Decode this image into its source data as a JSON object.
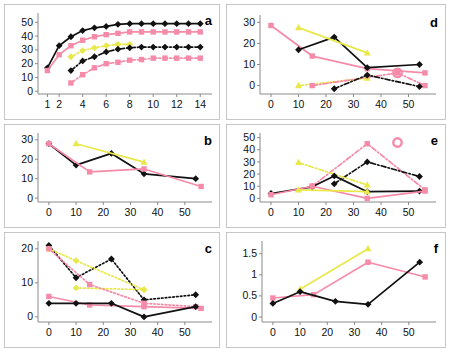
{
  "figure": {
    "title": "",
    "background": "#ffffff",
    "panel_count": 6,
    "colors": {
      "black": "#111111",
      "pink": "#f58ba8",
      "yellow": "#e9e84b",
      "axis": "#8a8a8a",
      "frame": "#b9b9b9"
    },
    "layout": "2 columns x 3 rows; left column a,b,c ; right column d,e,f"
  },
  "chart_data": [
    {
      "id": "a",
      "type": "line",
      "title": "a",
      "xlabel": "",
      "ylabel": "",
      "xlim": [
        0.2,
        15.0
      ],
      "ylim": [
        -2,
        56
      ],
      "xticks": [
        1,
        2,
        4,
        6,
        8,
        10,
        12,
        14
      ],
      "xticklabels": [
        "1",
        "2",
        "4",
        "6",
        "8",
        "10",
        "12",
        "14"
      ],
      "yticks": [
        0,
        10,
        20,
        30,
        40,
        50
      ],
      "yticklabels": [
        "0",
        "10",
        "20",
        "30",
        "40",
        "50"
      ],
      "grid": false,
      "legend": "none",
      "series": [
        {
          "name": "black-solid-diamond",
          "color": "#111111",
          "marker": "diamond",
          "linestyle": "solid",
          "x": [
            1,
            2,
            3,
            4,
            5,
            6,
            7,
            8,
            9,
            10,
            11,
            12,
            13,
            14
          ],
          "values": [
            17,
            33,
            39.5,
            44,
            46,
            47,
            48.5,
            49,
            49,
            49,
            49,
            49,
            49,
            49
          ]
        },
        {
          "name": "pink-solid-square-upper",
          "color": "#f58ba8",
          "marker": "square",
          "linestyle": "solid",
          "x": [
            1,
            2,
            3,
            4,
            5,
            6,
            7,
            8,
            9,
            10,
            11,
            12,
            13,
            14
          ],
          "values": [
            15,
            26.5,
            33,
            37,
            39.5,
            41,
            42,
            43,
            43,
            43,
            43,
            43,
            43,
            43
          ]
        },
        {
          "name": "yellow-dashdot-diamond",
          "color": "#e9e84b",
          "marker": "diamond",
          "linestyle": "dashdot",
          "x": [
            3,
            4,
            5,
            6,
            7,
            8
          ],
          "values": [
            25,
            29.5,
            31.5,
            33,
            34,
            34
          ]
        },
        {
          "name": "black-dashdot-diamond",
          "color": "#111111",
          "marker": "diamond",
          "linestyle": "dashdot",
          "x": [
            3,
            4,
            5,
            6,
            7,
            8,
            9,
            10,
            11,
            12,
            13,
            14
          ],
          "values": [
            15,
            22,
            25,
            28.5,
            30.5,
            31.5,
            32,
            32,
            32,
            32,
            32,
            32
          ]
        },
        {
          "name": "pink-dashdot-square-lower",
          "color": "#f58ba8",
          "marker": "square",
          "linestyle": "dashdot",
          "x": [
            3,
            4,
            5,
            6,
            7,
            8,
            9,
            10,
            11,
            12,
            13,
            14
          ],
          "values": [
            6,
            12,
            17,
            20,
            21,
            22.5,
            23,
            24,
            24,
            24,
            24,
            24
          ]
        }
      ]
    },
    {
      "id": "b",
      "type": "line",
      "title": "b",
      "xlabel": "",
      "ylabel": "",
      "xlim": [
        -4,
        60
      ],
      "ylim": [
        -2,
        33
      ],
      "xticks": [
        0,
        10,
        20,
        30,
        40,
        50
      ],
      "xticklabels": [
        "0",
        "10",
        "20",
        "30",
        "40",
        "50"
      ],
      "yticks": [
        0,
        10,
        20,
        30
      ],
      "yticklabels": [
        "0",
        "10",
        "20",
        "30"
      ],
      "grid": false,
      "legend": "none",
      "series": [
        {
          "name": "black-solid-diamond",
          "color": "#111111",
          "marker": "diamond",
          "linestyle": "solid",
          "x": [
            0,
            10,
            23,
            35,
            54
          ],
          "values": [
            28,
            17,
            23,
            12.5,
            10
          ]
        },
        {
          "name": "pink-solid-square",
          "color": "#f58ba8",
          "marker": "square",
          "linestyle": "solid",
          "x": [
            0,
            15,
            35,
            56
          ],
          "values": [
            28,
            13.5,
            15,
            6
          ]
        },
        {
          "name": "yellow-solid-triangle",
          "color": "#e9e84b",
          "marker": "triangle",
          "linestyle": "solid",
          "x": [
            10,
            35
          ],
          "values": [
            28,
            18.5
          ]
        }
      ]
    },
    {
      "id": "c",
      "type": "line",
      "title": "c",
      "xlabel": "",
      "ylabel": "",
      "xlim": [
        -4,
        60
      ],
      "ylim": [
        -1.5,
        22
      ],
      "xticks": [
        0,
        10,
        20,
        30,
        40,
        50
      ],
      "xticklabels": [
        "0",
        "10",
        "20",
        "30",
        "40",
        "50"
      ],
      "yticks": [
        0,
        10,
        20
      ],
      "yticklabels": [
        "0",
        "10",
        "20"
      ],
      "grid": false,
      "legend": "none",
      "series": [
        {
          "name": "black-dotted-diamond",
          "color": "#111111",
          "marker": "diamond",
          "linestyle": "dotted",
          "x": [
            0,
            10,
            23,
            35,
            54
          ],
          "values": [
            21,
            11.5,
            17,
            5,
            6.5
          ]
        },
        {
          "name": "yellow-dotted-upper",
          "color": "#e9e84b",
          "marker": "diamond",
          "linestyle": "dotted",
          "x": [
            0,
            10,
            35
          ],
          "values": [
            20,
            16.5,
            8
          ]
        },
        {
          "name": "yellow-dotted-lower",
          "color": "#e9e84b",
          "marker": "diamond",
          "linestyle": "dotted",
          "x": [
            10,
            35
          ],
          "values": [
            8.5,
            8
          ]
        },
        {
          "name": "pink-dotted-square",
          "color": "#f58ba8",
          "marker": "square",
          "linestyle": "dotted",
          "x": [
            0,
            15,
            35,
            54
          ],
          "values": [
            20,
            9.5,
            4,
            3
          ]
        },
        {
          "name": "pink-solid-square",
          "color": "#f58ba8",
          "marker": "square",
          "linestyle": "solid",
          "x": [
            0,
            15,
            35,
            56
          ],
          "values": [
            6,
            3.5,
            3,
            2.5
          ]
        },
        {
          "name": "black-solid-diamond",
          "color": "#111111",
          "marker": "diamond",
          "linestyle": "solid",
          "x": [
            0,
            10,
            23,
            35,
            54
          ],
          "values": [
            4,
            4,
            4,
            0,
            3
          ]
        }
      ]
    },
    {
      "id": "d",
      "type": "line",
      "title": "d",
      "xlabel": "",
      "ylabel": "",
      "xlim": [
        -4,
        60
      ],
      "ylim": [
        -4,
        33
      ],
      "xticks": [
        0,
        10,
        20,
        30,
        40,
        50
      ],
      "xticklabels": [
        "0",
        "10",
        "20",
        "30",
        "40",
        "50"
      ],
      "yticks": [
        0,
        10,
        20,
        30
      ],
      "yticklabels": [
        "0",
        "10",
        "20",
        "30"
      ],
      "grid": false,
      "legend": "none",
      "series": [
        {
          "name": "pink-solid-square-upper",
          "color": "#f58ba8",
          "marker": "square",
          "linestyle": "solid",
          "x": [
            0,
            15,
            35,
            56
          ],
          "values": [
            28.5,
            14,
            8,
            6
          ]
        },
        {
          "name": "black-solid-diamond",
          "color": "#111111",
          "marker": "diamond",
          "linestyle": "solid",
          "x": [
            10,
            23,
            35,
            54
          ],
          "values": [
            17,
            23,
            8.5,
            10
          ]
        },
        {
          "name": "yellow-solid-triangle-upper",
          "color": "#e9e84b",
          "marker": "triangle",
          "linestyle": "solid",
          "x": [
            10,
            35
          ],
          "values": [
            27.5,
            15.5
          ]
        },
        {
          "name": "yellow-dashdot-triangle-lower",
          "color": "#e9e84b",
          "marker": "triangle",
          "linestyle": "dashdot",
          "x": [
            10,
            35
          ],
          "values": [
            0,
            3.5
          ]
        },
        {
          "name": "pink-dashdot-square-lower",
          "color": "#f58ba8",
          "marker": "square",
          "linestyle": "dashdot",
          "x": [
            15,
            46,
            56
          ],
          "values": [
            0,
            6,
            0
          ]
        },
        {
          "name": "black-dashdot-diamond-lower",
          "color": "#111111",
          "marker": "diamond",
          "linestyle": "dashdot",
          "x": [
            23,
            35,
            54
          ],
          "values": [
            -1.5,
            5,
            -0.5
          ]
        },
        {
          "name": "pink-circle-marker",
          "color": "#f58ba8",
          "marker": "circle",
          "linestyle": "none",
          "x": [
            46
          ],
          "values": [
            6
          ]
        }
      ]
    },
    {
      "id": "e",
      "type": "line",
      "title": "e",
      "xlabel": "",
      "ylabel": "",
      "xlim": [
        -4,
        60
      ],
      "ylim": [
        -3,
        53
      ],
      "xticks": [
        0,
        10,
        20,
        30,
        40,
        50
      ],
      "xticklabels": [
        "0",
        "10",
        "20",
        "30",
        "40",
        "50"
      ],
      "yticks": [
        0,
        10,
        20,
        30,
        40,
        50
      ],
      "yticklabels": [
        "0",
        "10",
        "20",
        "30",
        "40",
        "50"
      ],
      "grid": false,
      "legend": "none",
      "series": [
        {
          "name": "pink-dashdot-square-peak",
          "color": "#f58ba8",
          "marker": "square",
          "linestyle": "dashdot",
          "x": [
            15,
            35,
            56
          ],
          "values": [
            10,
            45,
            7
          ]
        },
        {
          "name": "black-dashdot-diamond-peak",
          "color": "#111111",
          "marker": "diamond",
          "linestyle": "dashdot",
          "x": [
            23,
            35,
            54
          ],
          "values": [
            12,
            30,
            18
          ]
        },
        {
          "name": "yellow-dashdot-down",
          "color": "#e9e84b",
          "marker": "triangle",
          "linestyle": "dashdot",
          "x": [
            10,
            35
          ],
          "values": [
            29.5,
            11
          ]
        },
        {
          "name": "black-solid-diamond",
          "color": "#111111",
          "marker": "diamond",
          "linestyle": "solid",
          "x": [
            0,
            15,
            23,
            35,
            54
          ],
          "values": [
            4,
            9.5,
            18.5,
            5.5,
            6
          ]
        },
        {
          "name": "pink-solid-square",
          "color": "#f58ba8",
          "marker": "square",
          "linestyle": "solid",
          "x": [
            0,
            15,
            35,
            56
          ],
          "values": [
            3,
            10,
            0,
            6
          ]
        },
        {
          "name": "yellow-solid-triangle-low",
          "color": "#e9e84b",
          "marker": "triangle",
          "linestyle": "solid",
          "x": [
            10,
            35
          ],
          "values": [
            7,
            5.5
          ]
        },
        {
          "name": "pink-circle-marker",
          "color": "#f58ba8",
          "marker": "circle",
          "linestyle": "none",
          "x": [
            46
          ],
          "values": [
            46
          ]
        }
      ]
    },
    {
      "id": "f",
      "type": "line",
      "title": "f",
      "xlabel": "",
      "ylabel": "",
      "xlim": [
        -4,
        60
      ],
      "ylim": [
        -0.12,
        1.78
      ],
      "xticks": [
        0,
        10,
        20,
        30,
        40,
        50
      ],
      "xticklabels": [
        "0",
        "10",
        "20",
        "30",
        "40",
        "50"
      ],
      "yticks": [
        0,
        0.5,
        1,
        1.5
      ],
      "yticklabels": [
        "0",
        "0.5",
        "1",
        "1.5"
      ],
      "grid": false,
      "legend": "none",
      "series": [
        {
          "name": "yellow-solid-triangle",
          "color": "#e9e84b",
          "marker": "triangle",
          "linestyle": "solid",
          "x": [
            10,
            35
          ],
          "values": [
            0.66,
            1.62
          ]
        },
        {
          "name": "pink-solid-square",
          "color": "#f58ba8",
          "marker": "square",
          "linestyle": "solid",
          "x": [
            0,
            15,
            35,
            56
          ],
          "values": [
            0.45,
            0.53,
            1.3,
            0.95
          ]
        },
        {
          "name": "black-solid-diamond",
          "color": "#111111",
          "marker": "diamond",
          "linestyle": "solid",
          "x": [
            0,
            10,
            23,
            35,
            54
          ],
          "values": [
            0.32,
            0.6,
            0.37,
            0.3,
            1.3
          ]
        }
      ]
    }
  ]
}
